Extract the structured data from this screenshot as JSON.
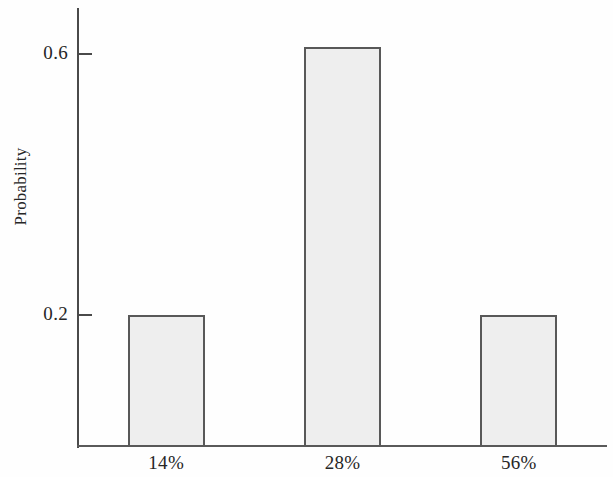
{
  "chart_data": {
    "type": "bar",
    "title": "",
    "subtitle": "",
    "xlabel": "",
    "ylabel": "Probability",
    "categories": [
      "14%",
      "28%",
      "56%"
    ],
    "values": [
      0.2,
      0.61,
      0.2
    ],
    "ylim": [
      0,
      0.655
    ],
    "ytick_values": [
      0.6,
      0.2
    ],
    "ytick_labels": [
      "0.6",
      "0.2"
    ],
    "grid": false,
    "legend": null,
    "legend_position": "none",
    "annotations": [],
    "style": {
      "bar_fill": "#eeeeee",
      "bar_border": "#585858",
      "axis_color": "#4a4a4a",
      "text_color": "#262626",
      "background": "#fefefe"
    },
    "bars": [
      {
        "category": "14%",
        "value": 0.2
      },
      {
        "category": "28%",
        "value": 0.61
      },
      {
        "category": "56%",
        "value": 0.2
      }
    ]
  }
}
